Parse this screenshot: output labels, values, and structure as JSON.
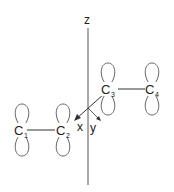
{
  "diagram": {
    "title": "",
    "axes": {
      "z_label": "z",
      "x_label": "x",
      "y_label": "y"
    },
    "atoms": [
      {
        "symbol": "C",
        "index": "1"
      },
      {
        "symbol": "C",
        "index": "2"
      },
      {
        "symbol": "C",
        "index": "3"
      },
      {
        "symbol": "C",
        "index": "4"
      }
    ],
    "colors": {
      "line": "#333333",
      "lobe": "#555555",
      "text": "#222222"
    }
  }
}
